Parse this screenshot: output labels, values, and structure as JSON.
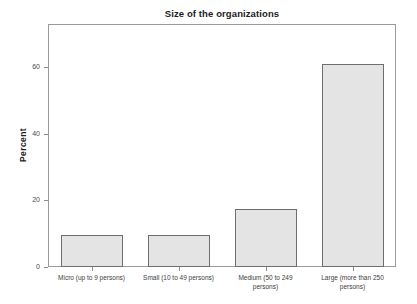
{
  "chart_data": {
    "type": "bar",
    "title": "Size of the organizations",
    "xlabel": "",
    "ylabel": "Percent",
    "ylim": [
      0,
      73
    ],
    "yticks": [
      0,
      20,
      40,
      60
    ],
    "ytick_labels": [
      "0",
      "20",
      "40",
      "60"
    ],
    "grid": false,
    "legend": null,
    "categories": [
      "Micro (up to 9 persons)",
      "Small (10 to 49 persons)",
      "Medium (50 to 249 persons)",
      "Large (more than 250 persons)"
    ],
    "category_lines": [
      [
        "Micro (up to 9 persons)"
      ],
      [
        "Small (10 to 49 persons)"
      ],
      [
        "Medium (50 to 249",
        "persons)"
      ],
      [
        "Large (more than 250",
        "persons)"
      ]
    ],
    "values": [
      9.6,
      9.6,
      17.4,
      61.1
    ],
    "bar_fill_color": "#e4e4e4",
    "bar_border_color": "#6e6e6e",
    "frame_color": "#9a9a9a",
    "text_color": "#1c1c1c"
  }
}
